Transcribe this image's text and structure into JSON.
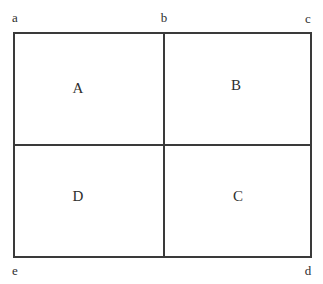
{
  "diagram": {
    "type": "partitioned-rectangle",
    "background_color": "#ffffff",
    "line_color": "#3a3a3a",
    "text_color": "#2e2e2e",
    "regions": [
      {
        "id": "A",
        "label": "A",
        "position": "top-left"
      },
      {
        "id": "B",
        "label": "B",
        "position": "top-right"
      },
      {
        "id": "C",
        "label": "C",
        "position": "bottom-right"
      },
      {
        "id": "D",
        "label": "D",
        "position": "bottom-left"
      }
    ],
    "vertices": [
      {
        "id": "a",
        "label": "a",
        "position": "top-left"
      },
      {
        "id": "b",
        "label": "b",
        "position": "top-center"
      },
      {
        "id": "c",
        "label": "c",
        "position": "top-right"
      },
      {
        "id": "d",
        "label": "d",
        "position": "bottom-right"
      },
      {
        "id": "e",
        "label": "e",
        "position": "bottom-left"
      }
    ]
  }
}
